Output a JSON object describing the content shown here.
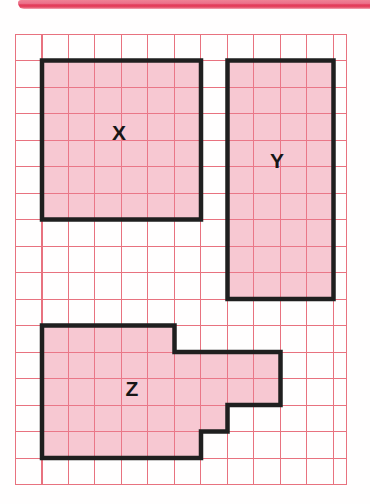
{
  "figure": {
    "description_hint": "Three shaded shapes of equal area drawn on squared paper",
    "grid": {
      "columns_visible": 12.5,
      "rows_visible": 17,
      "cell_size_px": 26.5,
      "line_color": "#e8727f",
      "paper_color": "#ffffff"
    },
    "colors": {
      "shape_fill": "#f7c9d3",
      "shape_outline": "#1f1f1f",
      "label_color": "#161616",
      "title_bar_pink": "#ec7089",
      "title_bar_crimson": "#e23a58"
    }
  },
  "shapes": [
    {
      "label": "X",
      "kind": "square",
      "width_cells": 6,
      "height_cells": 6,
      "area_squares": 36,
      "grid_origin_cell": [
        1,
        1
      ],
      "vertices_cells": [
        [
          1,
          1
        ],
        [
          7,
          1
        ],
        [
          7,
          7
        ],
        [
          1,
          7
        ]
      ]
    },
    {
      "label": "Y",
      "kind": "rectangle",
      "width_cells": 4,
      "height_cells": 9,
      "area_squares": 36,
      "grid_origin_cell": [
        8,
        1
      ],
      "vertices_cells": [
        [
          8,
          1
        ],
        [
          12,
          1
        ],
        [
          12,
          10
        ],
        [
          8,
          10
        ]
      ]
    },
    {
      "label": "Z",
      "kind": "rectilinear-polygon",
      "area_squares": 36,
      "grid_origin_cell": [
        1,
        11
      ],
      "vertices_cells": [
        [
          1,
          11
        ],
        [
          6,
          11
        ],
        [
          6,
          12
        ],
        [
          10,
          12
        ],
        [
          10,
          14
        ],
        [
          8,
          14
        ],
        [
          8,
          15
        ],
        [
          7,
          15
        ],
        [
          7,
          16
        ],
        [
          1,
          16
        ]
      ]
    }
  ]
}
